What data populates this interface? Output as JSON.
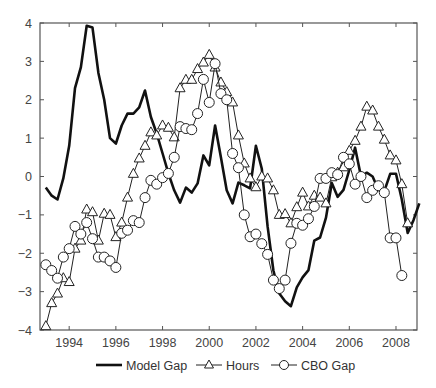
{
  "chart_data": {
    "type": "line",
    "title": "",
    "xlabel": "",
    "ylabel": "",
    "xlim": [
      1992.75,
      2008.9
    ],
    "ylim": [
      -4,
      4
    ],
    "grid": false,
    "legend_position": "bottom",
    "x_ticks": [
      1994,
      1996,
      1998,
      2000,
      2002,
      2004,
      2006,
      2008
    ],
    "x_tick_labels": [
      "1994",
      "1996",
      "1998",
      "2000",
      "2002",
      "2004",
      "2006",
      "2008"
    ],
    "y_ticks": [
      -4,
      -3,
      -2,
      -1,
      0,
      1,
      2,
      3,
      4
    ],
    "y_tick_labels": [
      "−4",
      "−3",
      "−2",
      "−1",
      "0",
      "1",
      "2",
      "3",
      "4"
    ],
    "x_start": 1993.0,
    "x_step": 0.25,
    "series": [
      {
        "name": "Model Gap",
        "marker": "none",
        "line_width": 2.6,
        "color": "#111111",
        "values": [
          -0.29,
          -0.5,
          -0.6,
          -0.05,
          0.8,
          2.3,
          2.85,
          3.93,
          3.88,
          2.7,
          2.0,
          1.0,
          0.86,
          1.33,
          1.64,
          1.64,
          1.8,
          2.24,
          1.55,
          1.12,
          0.6,
          0.08,
          -0.36,
          -0.68,
          -0.29,
          -0.42,
          -0.18,
          0.55,
          0.29,
          1.33,
          0.5,
          -0.36,
          -0.7,
          -0.16,
          -0.23,
          -0.31,
          0.8,
          0.2,
          -1.3,
          -2.45,
          -3.05,
          -3.25,
          -3.38,
          -2.89,
          -2.63,
          -2.44,
          -1.67,
          -1.59,
          -1.07,
          -0.17,
          -0.53,
          -0.35,
          0.17,
          0.75,
          0.0,
          0.1,
          0.0,
          -0.35,
          -0.38,
          0.07,
          0.07,
          -0.6,
          -1.47,
          -1.14,
          -0.7
        ]
      },
      {
        "name": "Hours",
        "marker": "triangle",
        "line_width": 1,
        "color": "#222222",
        "values": [
          -3.9,
          -3.3,
          -3.05,
          -2.65,
          -2.75,
          -1.88,
          -1.67,
          -0.86,
          -0.93,
          -1.67,
          -0.97,
          -1.0,
          -1.58,
          -1.2,
          -0.55,
          0.07,
          0.47,
          0.8,
          1.15,
          1.07,
          1.33,
          1.27,
          1.02,
          2.3,
          2.52,
          2.52,
          2.8,
          2.97,
          3.17,
          2.84,
          2.45,
          2.2,
          1.93,
          1.07,
          0.34,
          -0.05,
          -0.28,
          0.0,
          -0.05,
          -0.36,
          -1.0,
          -0.98,
          -1.22,
          -0.8,
          -0.42,
          -0.78,
          -0.5,
          -0.55,
          -0.7,
          -0.02,
          0.1,
          0.24,
          0.67,
          0.93,
          1.3,
          1.82,
          1.72,
          1.3,
          0.96,
          0.55,
          0.42,
          -0.2,
          -1.22
        ]
      },
      {
        "name": "CBO Gap",
        "marker": "circle",
        "line_width": 1,
        "color": "#222222",
        "values": [
          -2.3,
          -2.45,
          -2.65,
          -2.1,
          -1.88,
          -1.3,
          -1.5,
          -1.2,
          -1.62,
          -2.1,
          -2.1,
          -2.2,
          -2.37,
          -1.48,
          -1.4,
          -1.15,
          -1.2,
          -0.55,
          -0.1,
          -0.2,
          -0.03,
          0.08,
          0.5,
          1.3,
          1.25,
          1.22,
          1.64,
          2.53,
          1.93,
          2.94,
          2.16,
          2.0,
          0.6,
          0.23,
          -1.0,
          -1.57,
          -1.5,
          -1.75,
          -2.03,
          -2.7,
          -2.92,
          -2.7,
          -1.74,
          -1.22,
          -1.27,
          -1.1,
          -0.78,
          -0.05,
          -0.05,
          0.1,
          0.05,
          0.5,
          0.33,
          -0.2,
          0.0,
          -0.55,
          -0.36,
          -0.24,
          -0.42,
          -1.6,
          -1.6,
          -2.58
        ]
      }
    ]
  },
  "legend": {
    "items": [
      {
        "label": "Model Gap",
        "marker": "none"
      },
      {
        "label": "Hours",
        "marker": "triangle"
      },
      {
        "label": "CBO Gap",
        "marker": "circle"
      }
    ]
  }
}
